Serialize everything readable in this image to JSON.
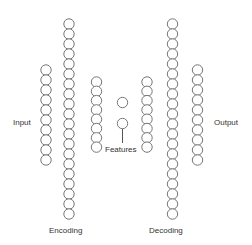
{
  "diagram": {
    "type": "autoencoder",
    "labels": {
      "input": "Input",
      "encoding": "Encoding",
      "features": "Features",
      "decoding": "Decoding",
      "output": "Output"
    },
    "colors": {
      "node_stroke": "#777777",
      "node_fill": "#ffffff",
      "text": "#333333"
    },
    "node_radius": 5.2,
    "layers": [
      {
        "name": "input",
        "nodes": 10,
        "cx": 46,
        "y_start": 70,
        "spacing": 10
      },
      {
        "name": "encoding",
        "nodes": 20,
        "cx": 69,
        "y_start": 24,
        "spacing": 10
      },
      {
        "name": "encoder-hidden",
        "nodes": 8,
        "cx": 96.5,
        "y_start": 82,
        "spacing": 9.3
      },
      {
        "name": "features",
        "nodes": 2,
        "cx": 122.5,
        "y_start": 102.5,
        "spacing": 21
      },
      {
        "name": "decoder-hidden",
        "nodes": 8,
        "cx": 147,
        "y_start": 82,
        "spacing": 9.3
      },
      {
        "name": "decoding",
        "nodes": 20,
        "cx": 172.5,
        "y_start": 24,
        "spacing": 10
      },
      {
        "name": "output",
        "nodes": 10,
        "cx": 197.5,
        "y_start": 70,
        "spacing": 10
      }
    ]
  }
}
